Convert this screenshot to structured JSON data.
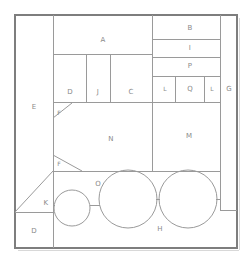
{
  "diagram": {
    "type": "2d-packing-layout",
    "canvas": {
      "width": 252,
      "height": 264
    },
    "frame": {
      "x": 15,
      "y": 15,
      "width": 222,
      "height": 233
    },
    "stroke_color": "#9a9a9a",
    "outer_stroke_color": "#7e7e7e",
    "label_color": "#8a8a8a",
    "background_color": "#ffffff",
    "regions": [
      {
        "id": "E",
        "label": "E",
        "cx": 34,
        "cy": 107,
        "shape": "rect"
      },
      {
        "id": "A",
        "label": "A",
        "cx": 103,
        "cy": 40,
        "shape": "rect"
      },
      {
        "id": "B",
        "label": "B",
        "cx": 190,
        "cy": 28,
        "shape": "rect"
      },
      {
        "id": "I",
        "label": "I",
        "cx": 190,
        "cy": 48,
        "shape": "rect"
      },
      {
        "id": "P",
        "label": "P",
        "cx": 190,
        "cy": 66,
        "shape": "rect"
      },
      {
        "id": "L1",
        "label": "L",
        "cx": 165,
        "cy": 88,
        "shape": "rect"
      },
      {
        "id": "Q",
        "label": "Q",
        "cx": 190,
        "cy": 88,
        "shape": "rect"
      },
      {
        "id": "L2",
        "label": "L",
        "cx": 212,
        "cy": 88,
        "shape": "rect"
      },
      {
        "id": "G",
        "label": "G",
        "cx": 230,
        "cy": 88,
        "shape": "rect"
      },
      {
        "id": "D1",
        "label": "D",
        "cx": 71,
        "cy": 92,
        "shape": "rect"
      },
      {
        "id": "J",
        "label": "J",
        "cx": 99,
        "cy": 92,
        "shape": "rect"
      },
      {
        "id": "C",
        "label": "C",
        "cx": 130,
        "cy": 92,
        "shape": "rect"
      },
      {
        "id": "N",
        "label": "N",
        "cx": 111,
        "cy": 139,
        "shape": "polygon"
      },
      {
        "id": "M",
        "label": "M",
        "cx": 189,
        "cy": 135,
        "shape": "rect"
      },
      {
        "id": "F1",
        "label": "F",
        "cx": 59,
        "cy": 112,
        "shape": "triangle"
      },
      {
        "id": "F2",
        "label": "F",
        "cx": 59,
        "cy": 163,
        "shape": "triangle"
      },
      {
        "id": "K",
        "label": "K",
        "cx": 46,
        "cy": 203,
        "shape": "triangle"
      },
      {
        "id": "D2",
        "label": "D",
        "cx": 34,
        "cy": 231,
        "shape": "rect"
      },
      {
        "id": "O",
        "label": "O",
        "cx": 98,
        "cy": 184,
        "shape": "rect"
      },
      {
        "id": "H",
        "label": "H",
        "cx": 160,
        "cy": 229,
        "shape": "rect"
      }
    ],
    "circles": [
      {
        "id": "circle-small",
        "cx": 72,
        "cy": 208,
        "r": 18
      },
      {
        "id": "circle-large-1",
        "cx": 128,
        "cy": 199,
        "r": 29
      },
      {
        "id": "circle-large-2",
        "cx": 188,
        "cy": 199,
        "r": 29
      }
    ],
    "segments": {
      "vertical": [
        {
          "id": "v-E-right",
          "x": 53,
          "y1": 15,
          "y2": 248
        },
        {
          "id": "v-D1-right",
          "x": 86,
          "y1": 54,
          "y2": 102
        },
        {
          "id": "v-J-right",
          "x": 110,
          "y1": 54,
          "y2": 102
        },
        {
          "id": "v-A-right",
          "x": 152,
          "y1": 15,
          "y2": 171
        },
        {
          "id": "v-L1-right",
          "x": 175,
          "y1": 76,
          "y2": 102
        },
        {
          "id": "v-Q-right",
          "x": 204,
          "y1": 76,
          "y2": 102
        },
        {
          "id": "v-G-left",
          "x": 220,
          "y1": 15,
          "y2": 210
        },
        {
          "id": "v-M-right",
          "x": 220,
          "y1": 102,
          "y2": 171
        }
      ],
      "horizontal": [
        {
          "id": "h-A-bottom",
          "x1": 53,
          "x2": 152,
          "y": 54
        },
        {
          "id": "h-B-bottom",
          "x1": 152,
          "x2": 220,
          "y": 39
        },
        {
          "id": "h-I-bottom",
          "x1": 152,
          "x2": 220,
          "y": 57
        },
        {
          "id": "h-P-bottom",
          "x1": 152,
          "x2": 220,
          "y": 76
        },
        {
          "id": "h-L-bottom",
          "x1": 152,
          "x2": 220,
          "y": 102
        },
        {
          "id": "h-row-bottom",
          "x1": 53,
          "x2": 152,
          "y": 102
        },
        {
          "id": "h-N-bottom",
          "x1": 53,
          "x2": 220,
          "y": 171
        },
        {
          "id": "h-K-bottom",
          "x1": 15,
          "x2": 53,
          "y": 212
        },
        {
          "id": "h-G-bottom",
          "x1": 220,
          "x2": 237,
          "y": 210
        }
      ],
      "diagonal": [
        {
          "id": "d-F1",
          "x1": 53,
          "y1": 118,
          "x2": 72,
          "y2": 103
        },
        {
          "id": "d-F2",
          "x1": 53,
          "y1": 155,
          "x2": 82,
          "y2": 171
        },
        {
          "id": "d-K",
          "x1": 15,
          "y1": 212,
          "x2": 53,
          "y2": 171
        }
      ],
      "connectors": [
        {
          "id": "c-small-to-large",
          "x1": 90,
          "y1": 205,
          "x2": 100,
          "y2": 205
        },
        {
          "id": "c-large-to-large",
          "x1": 156,
          "y1": 199,
          "x2": 160,
          "y2": 199
        },
        {
          "id": "c-left-stub",
          "x1": 53,
          "y1": 205,
          "x2": 55,
          "y2": 205
        },
        {
          "id": "c-right-stub",
          "x1": 216,
          "y1": 199,
          "x2": 220,
          "y2": 199
        }
      ]
    }
  }
}
